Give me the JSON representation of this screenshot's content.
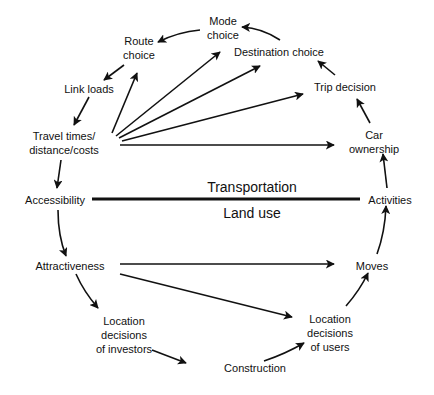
{
  "diagram": {
    "divider": {
      "upper_label": "Transportation",
      "lower_label": "Land use"
    },
    "nodes": {
      "mode_choice": [
        "Mode",
        "choice"
      ],
      "route_choice": [
        "Route",
        "choice"
      ],
      "destination_choice": [
        "Destination choice"
      ],
      "link_loads": [
        "Link loads"
      ],
      "trip_decision": [
        "Trip decision"
      ],
      "travel_times": [
        "Travel times/",
        "distance/costs"
      ],
      "car_ownership": [
        "Car",
        "ownership"
      ],
      "accessibility": [
        "Accessibility"
      ],
      "activities": [
        "Activities"
      ],
      "attractiveness": [
        "Attractiveness"
      ],
      "moves": [
        "Moves"
      ],
      "investors": [
        "Location",
        "decisions",
        "of investors"
      ],
      "users": [
        "Location",
        "decisions",
        "of users"
      ],
      "construction": [
        "Construction"
      ]
    },
    "edges": [
      {
        "from": "Destination choice",
        "to": "Mode choice"
      },
      {
        "from": "Mode choice",
        "to": "Route choice"
      },
      {
        "from": "Route choice",
        "to": "Link loads"
      },
      {
        "from": "Link loads",
        "to": "Travel times/distance/costs"
      },
      {
        "from": "Travel times/distance/costs",
        "to": "Route choice"
      },
      {
        "from": "Travel times/distance/costs",
        "to": "Mode choice"
      },
      {
        "from": "Travel times/distance/costs",
        "to": "Destination choice"
      },
      {
        "from": "Travel times/distance/costs",
        "to": "Trip decision"
      },
      {
        "from": "Travel times/distance/costs",
        "to": "Car ownership"
      },
      {
        "from": "Travel times/distance/costs",
        "to": "Accessibility"
      },
      {
        "from": "Trip decision",
        "to": "Destination choice"
      },
      {
        "from": "Car ownership",
        "to": "Trip decision"
      },
      {
        "from": "Activities",
        "to": "Car ownership"
      },
      {
        "from": "Moves",
        "to": "Activities"
      },
      {
        "from": "Location decisions of users",
        "to": "Moves"
      },
      {
        "from": "Construction",
        "to": "Location decisions of users"
      },
      {
        "from": "Location decisions of investors",
        "to": "Construction"
      },
      {
        "from": "Attractiveness",
        "to": "Location decisions of investors"
      },
      {
        "from": "Attractiveness",
        "to": "Moves"
      },
      {
        "from": "Attractiveness",
        "to": "Location decisions of users"
      },
      {
        "from": "Accessibility",
        "to": "Attractiveness"
      }
    ],
    "colors": {
      "background": "#ffffff",
      "ink": "#111111"
    }
  }
}
